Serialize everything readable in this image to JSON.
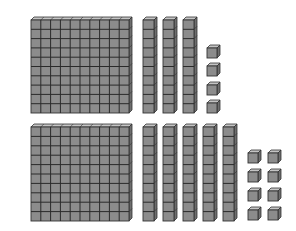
{
  "diagram": {
    "title": "Base-ten blocks",
    "colors": {
      "face": "#8c8c8c",
      "top": "#c4c4c4",
      "side": "#6e6e6e",
      "grid": "#2a2a2a",
      "outline": "#333333",
      "background": "#ffffff"
    },
    "groups": [
      {
        "name": "top-group",
        "label": "1 hundred, 3 tens, 4 ones",
        "value": 134,
        "hundreds": [
          {
            "x": 31,
            "y": 17,
            "w": 98,
            "h": 96
          }
        ],
        "tens": [
          {
            "x": 143,
            "y": 17,
            "w": 11,
            "h": 96
          },
          {
            "x": 163,
            "y": 17,
            "w": 11,
            "h": 96
          },
          {
            "x": 183,
            "y": 17,
            "w": 11,
            "h": 96
          }
        ],
        "ones": [
          {
            "x": 207,
            "y": 48,
            "s": 10
          },
          {
            "x": 207,
            "y": 66,
            "s": 10
          },
          {
            "x": 207,
            "y": 85,
            "s": 10
          },
          {
            "x": 207,
            "y": 103,
            "s": 10
          }
        ]
      },
      {
        "name": "bottom-group",
        "label": "1 hundred, 5 tens, 8 ones",
        "value": 158,
        "hundreds": [
          {
            "x": 31,
            "y": 124,
            "w": 98,
            "h": 97
          }
        ],
        "tens": [
          {
            "x": 143,
            "y": 124,
            "w": 11,
            "h": 97
          },
          {
            "x": 163,
            "y": 124,
            "w": 11,
            "h": 97
          },
          {
            "x": 183,
            "y": 124,
            "w": 11,
            "h": 97
          },
          {
            "x": 203,
            "y": 124,
            "w": 11,
            "h": 97
          },
          {
            "x": 223,
            "y": 124,
            "w": 11,
            "h": 97
          }
        ],
        "ones": [
          {
            "x": 248,
            "y": 153,
            "s": 10
          },
          {
            "x": 268,
            "y": 153,
            "s": 10
          },
          {
            "x": 248,
            "y": 172,
            "s": 10
          },
          {
            "x": 268,
            "y": 172,
            "s": 10
          },
          {
            "x": 248,
            "y": 191,
            "s": 10
          },
          {
            "x": 268,
            "y": 191,
            "s": 10
          },
          {
            "x": 248,
            "y": 210,
            "s": 10
          },
          {
            "x": 268,
            "y": 210,
            "s": 10
          }
        ]
      }
    ]
  }
}
